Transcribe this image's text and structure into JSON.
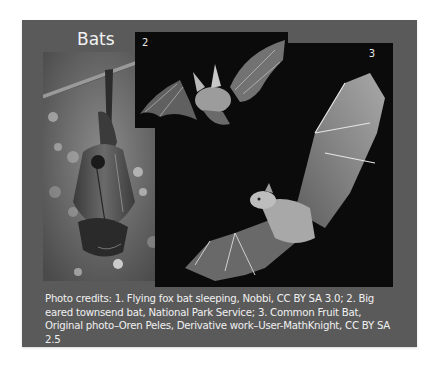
{
  "slide": {
    "title": "Bats",
    "background_color": "#5a5a5a",
    "photos": [
      {
        "number": "1",
        "subject": "Flying fox bat sleeping"
      },
      {
        "number": "2",
        "subject": "Big eared townsend bat"
      },
      {
        "number": "3",
        "subject": "Common Fruit Bat"
      }
    ],
    "credits": "Photo credits:  1. Flying fox bat sleeping, Nobbi, CC BY SA 3.0;  2. Big eared townsend bat, National Park Service;  3. Common Fruit Bat, Original photo–Oren Peles, Derivative work–User-MathKnight, CC BY SA 2.5"
  }
}
